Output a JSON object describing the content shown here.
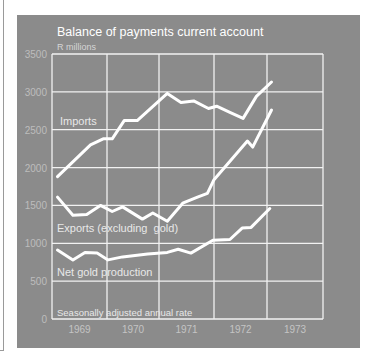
{
  "chart_data": {
    "type": "line",
    "title": "Balance of payments current account",
    "ylabel": "R millions",
    "xlabel": "",
    "note": "Seasonally adjusted annual rate",
    "ylim": [
      0,
      3500
    ],
    "yticks": [
      0,
      500,
      1000,
      1500,
      2000,
      2500,
      3000,
      3500
    ],
    "ytick_labels": [
      "0",
      "500",
      "1000",
      "1500",
      "2000",
      "2500",
      "3000",
      "3500"
    ],
    "xlim": [
      1969,
      1974
    ],
    "categories": [
      "1969",
      "1970",
      "1971",
      "1972",
      "1973"
    ],
    "grid": true,
    "legend": "inline labels",
    "colors": {
      "panel": "#8b8b8b",
      "lines": "#ffffff",
      "grid": "#f2f2f2"
    },
    "series": [
      {
        "name": "Imports",
        "label": "Imports",
        "x": [
          1969.1,
          1969.7,
          1969.93,
          1970.1,
          1970.33,
          1970.58,
          1971.15,
          1971.4,
          1971.63,
          1971.9,
          1972.05,
          1972.3,
          1972.55,
          1972.8,
          1973.08
        ],
        "y": [
          1880,
          2300,
          2380,
          2380,
          2620,
          2620,
          2980,
          2860,
          2880,
          2780,
          2810,
          2730,
          2650,
          2940,
          3130
        ]
      },
      {
        "name": "Exports (excluding gold)",
        "label": "Exports (excluding  gold)",
        "x": [
          1969.1,
          1969.38,
          1969.63,
          1969.88,
          1970.1,
          1970.3,
          1970.68,
          1970.88,
          1971.15,
          1971.43,
          1971.7,
          1971.88,
          1972.0,
          1972.63,
          1972.73,
          1973.08
        ],
        "y": [
          1610,
          1370,
          1380,
          1500,
          1420,
          1480,
          1320,
          1400,
          1290,
          1530,
          1610,
          1660,
          1840,
          2350,
          2270,
          2760
        ]
      },
      {
        "name": "Net gold production",
        "label": "Net gold production",
        "x": [
          1969.1,
          1969.38,
          1969.6,
          1969.82,
          1970.02,
          1970.3,
          1970.78,
          1971.15,
          1971.35,
          1971.58,
          1971.98,
          1972.3,
          1972.53,
          1972.7,
          1973.05
        ],
        "y": [
          910,
          780,
          880,
          870,
          780,
          820,
          860,
          880,
          920,
          870,
          1040,
          1050,
          1200,
          1210,
          1460
        ]
      }
    ]
  }
}
